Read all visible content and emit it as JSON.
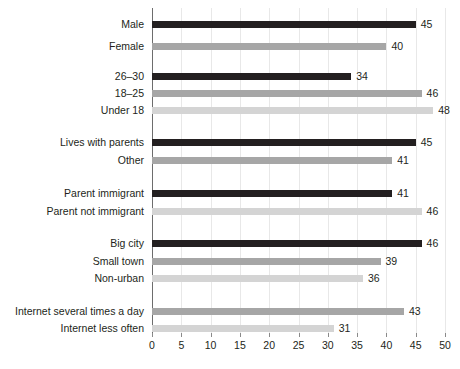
{
  "chart_data": {
    "type": "bar",
    "orientation": "horizontal",
    "title": "",
    "subtitle": "",
    "xlabel": "",
    "ylabel": "",
    "xlim": [
      0,
      50
    ],
    "xticks": [
      0,
      5,
      10,
      15,
      20,
      25,
      30,
      35,
      40,
      45,
      50
    ],
    "xtick_labels": [
      "0",
      "5",
      "10",
      "15",
      "20",
      "25",
      "30",
      "35",
      "40",
      "45",
      "50"
    ],
    "grid": true,
    "grid_axis": "x",
    "legend": "none",
    "colors": {
      "dark": "#231f20",
      "medium": "#a6a6a6",
      "light": "#d4d4d4",
      "gridline": "#e8e8e8",
      "axis": "#6d6d6d"
    },
    "categories": [
      "Male",
      "Female",
      "26–30",
      "18–25",
      "Under 18",
      "Lives with parents",
      "Other",
      "Parent immigrant",
      "Parent not immigrant",
      "Big city",
      "Small town",
      "Non-urban",
      "Internet several times a day",
      "Internet less often"
    ],
    "values": [
      45,
      40,
      34,
      46,
      48,
      45,
      41,
      41,
      46,
      46,
      39,
      36,
      43,
      31
    ],
    "groups": [
      {
        "name": "gender",
        "bars": [
          {
            "label": "Male",
            "value": 45,
            "shade": "dark"
          },
          {
            "label": "Female",
            "value": 40,
            "shade": "medium"
          }
        ]
      },
      {
        "name": "age",
        "bars": [
          {
            "label": "26–30",
            "value": 34,
            "shade": "dark"
          },
          {
            "label": "18–25",
            "value": 46,
            "shade": "medium"
          },
          {
            "label": "Under 18",
            "value": 48,
            "shade": "light"
          }
        ]
      },
      {
        "name": "living-situation",
        "bars": [
          {
            "label": "Lives with parents",
            "value": 45,
            "shade": "dark"
          },
          {
            "label": "Other",
            "value": 41,
            "shade": "medium"
          }
        ]
      },
      {
        "name": "parent-origin",
        "bars": [
          {
            "label": "Parent immigrant",
            "value": 41,
            "shade": "dark"
          },
          {
            "label": "Parent not immigrant",
            "value": 46,
            "shade": "light"
          }
        ]
      },
      {
        "name": "urbanicity",
        "bars": [
          {
            "label": "Big city",
            "value": 46,
            "shade": "dark"
          },
          {
            "label": "Small town",
            "value": 39,
            "shade": "medium"
          },
          {
            "label": "Non-urban",
            "value": 36,
            "shade": "light"
          }
        ]
      },
      {
        "name": "internet-use",
        "bars": [
          {
            "label": "Internet several times a day",
            "value": 43,
            "shade": "medium"
          },
          {
            "label": "Internet less often",
            "value": 31,
            "shade": "light"
          }
        ]
      }
    ],
    "rows": [
      {
        "label": "Male",
        "value": 45,
        "shade": "dark",
        "y": 13
      },
      {
        "label": "Female",
        "value": 40,
        "shade": "medium",
        "y": 35
      },
      {
        "label": "26–30",
        "value": 34,
        "shade": "dark",
        "y": 65
      },
      {
        "label": "18–25",
        "value": 46,
        "shade": "medium",
        "y": 82
      },
      {
        "label": "Under 18",
        "value": 48,
        "shade": "light",
        "y": 99
      },
      {
        "label": "Lives with parents",
        "value": 45,
        "shade": "dark",
        "y": 131
      },
      {
        "label": "Other",
        "value": 41,
        "shade": "medium",
        "y": 149
      },
      {
        "label": "Parent immigrant",
        "value": 41,
        "shade": "dark",
        "y": 182
      },
      {
        "label": "Parent not immigrant",
        "value": 46,
        "shade": "light",
        "y": 200
      },
      {
        "label": "Big city",
        "value": 46,
        "shade": "dark",
        "y": 232
      },
      {
        "label": "Small town",
        "value": 39,
        "shade": "medium",
        "y": 250
      },
      {
        "label": "Non-urban",
        "value": 36,
        "shade": "light",
        "y": 267
      },
      {
        "label": "Internet several times a day",
        "value": 43,
        "shade": "medium",
        "y": 300
      },
      {
        "label": "Internet less often",
        "value": 31,
        "shade": "light",
        "y": 317
      }
    ]
  }
}
